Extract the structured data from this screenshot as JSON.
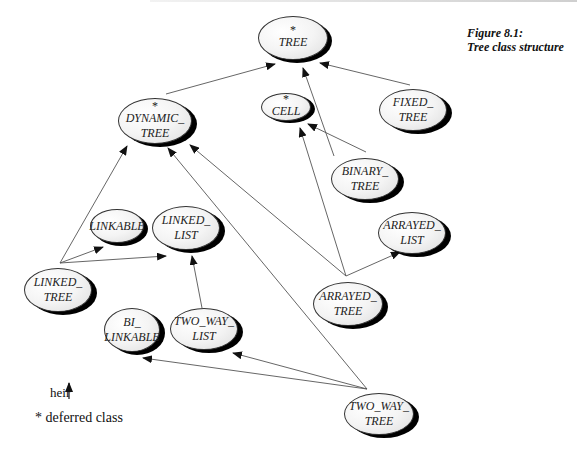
{
  "figure": {
    "caption_line1": "Figure 8.1:",
    "caption_line2": "Tree class structure"
  },
  "legend": {
    "heir_label": "heir",
    "deferred_label": "* deferred class"
  },
  "nodes": {
    "tree": {
      "star": "*",
      "label": "TREE",
      "deferred": true
    },
    "dynamic_tree": {
      "star": "*",
      "label": "DYNAMIC_\nTREE",
      "deferred": true
    },
    "cell": {
      "star": "*",
      "label": "CELL",
      "deferred": true
    },
    "fixed_tree": {
      "star": "",
      "label": "FIXED_\nTREE",
      "deferred": false
    },
    "binary_tree": {
      "star": "",
      "label": "BINARY_\nTREE",
      "deferred": false
    },
    "arrayed_list": {
      "star": "",
      "label": "ARRAYED_\nLIST",
      "deferred": false
    },
    "linkable": {
      "star": "",
      "label": "LINKABLE",
      "deferred": false
    },
    "linked_list": {
      "star": "",
      "label": "LINKED_\nLIST",
      "deferred": false
    },
    "linked_tree": {
      "star": "",
      "label": "LINKED_\nTREE",
      "deferred": false
    },
    "arrayed_tree": {
      "star": "",
      "label": "ARRAYED_\nTREE",
      "deferred": false
    },
    "bi_linkable": {
      "star": "",
      "label": "BI_\nLINKABLE",
      "deferred": false
    },
    "two_way_list": {
      "star": "",
      "label": "TWO_WAY_\nLIST",
      "deferred": false
    },
    "two_way_tree": {
      "star": "",
      "label": "TWO_WAY_\nTREE",
      "deferred": false
    }
  },
  "edges": [
    {
      "from": "DYNAMIC_TREE",
      "to": "TREE"
    },
    {
      "from": "BINARY_TREE",
      "to": "TREE"
    },
    {
      "from": "FIXED_TREE",
      "to": "TREE"
    },
    {
      "from": "BINARY_TREE",
      "to": "CELL"
    },
    {
      "from": "ARRAYED_TREE",
      "to": "CELL"
    },
    {
      "from": "ARRAYED_TREE",
      "to": "DYNAMIC_TREE"
    },
    {
      "from": "ARRAYED_TREE",
      "to": "ARRAYED_LIST"
    },
    {
      "from": "LINKED_TREE",
      "to": "DYNAMIC_TREE"
    },
    {
      "from": "LINKED_TREE",
      "to": "LINKABLE"
    },
    {
      "from": "LINKED_TREE",
      "to": "LINKED_LIST"
    },
    {
      "from": "TWO_WAY_LIST",
      "to": "LINKED_LIST"
    },
    {
      "from": "TWO_WAY_TREE",
      "to": "DYNAMIC_TREE"
    },
    {
      "from": "TWO_WAY_TREE",
      "to": "TWO_WAY_LIST"
    },
    {
      "from": "TWO_WAY_TREE",
      "to": "BI_LINKABLE"
    }
  ]
}
